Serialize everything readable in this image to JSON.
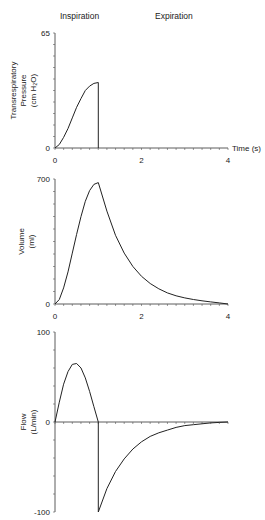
{
  "header": {
    "inspiration_label": "Inspiration",
    "expiration_label": "Expiration"
  },
  "chart_data": [
    {
      "type": "line",
      "title": "",
      "xlabel": "Time (s)",
      "ylabel": "Transrespiratory Pressure (cm H2O)",
      "ylabel_lines": [
        "Transrespiratory",
        "Pressure",
        "(cm H₂O)"
      ],
      "xlim": [
        0,
        4
      ],
      "ylim": [
        0,
        65
      ],
      "x_ticks": [
        0,
        2,
        4
      ],
      "y_ticks": [
        0,
        65
      ],
      "grid": false,
      "series": [
        {
          "name": "Pressure",
          "x": [
            0,
            0.1,
            0.2,
            0.3,
            0.4,
            0.5,
            0.6,
            0.7,
            0.8,
            0.9,
            1.0,
            1.0
          ],
          "values": [
            0,
            2,
            6,
            11,
            17,
            23,
            28,
            32.5,
            35,
            36.5,
            37,
            0
          ]
        }
      ]
    },
    {
      "type": "line",
      "title": "",
      "xlabel": "",
      "ylabel": "Volume (ml)",
      "ylabel_lines": [
        "Volume",
        "(ml)"
      ],
      "xlim": [
        0,
        4
      ],
      "ylim": [
        0,
        700
      ],
      "x_ticks": [
        0,
        2,
        4
      ],
      "y_ticks": [
        0,
        700
      ],
      "grid": false,
      "series": [
        {
          "name": "Volume",
          "x": [
            0,
            0.1,
            0.2,
            0.3,
            0.4,
            0.5,
            0.6,
            0.7,
            0.8,
            0.9,
            1.0,
            1.2,
            1.4,
            1.6,
            1.8,
            2.0,
            2.2,
            2.4,
            2.6,
            2.8,
            3.0,
            3.2,
            3.4,
            3.6,
            3.8,
            4.0
          ],
          "values": [
            0,
            25,
            90,
            180,
            285,
            390,
            490,
            575,
            635,
            670,
            680,
            520,
            385,
            285,
            210,
            155,
            115,
            85,
            62,
            46,
            34,
            25,
            18,
            12,
            6,
            0
          ]
        }
      ]
    },
    {
      "type": "line",
      "title": "",
      "xlabel": "",
      "ylabel": "Flow (L/min)",
      "ylabel_lines": [
        "Flow",
        "(L/min)"
      ],
      "xlim": [
        0,
        4
      ],
      "ylim": [
        -100,
        100
      ],
      "x_ticks": [],
      "y_ticks": [
        -100,
        0,
        100
      ],
      "grid": false,
      "series": [
        {
          "name": "Flow",
          "x": [
            0,
            0.1,
            0.2,
            0.3,
            0.4,
            0.5,
            0.6,
            0.7,
            0.8,
            0.9,
            1.0,
            1.0,
            1.2,
            1.4,
            1.6,
            1.8,
            2.0,
            2.2,
            2.4,
            2.6,
            2.8,
            3.0,
            3.2,
            3.4,
            3.6,
            3.8,
            4.0
          ],
          "values": [
            0,
            22,
            42,
            56,
            64,
            65,
            60,
            49,
            34,
            17,
            0,
            -100,
            -74,
            -55,
            -41,
            -30,
            -22,
            -16,
            -12,
            -9,
            -6,
            -4,
            -3,
            -2,
            -1,
            -0.5,
            0
          ]
        }
      ]
    }
  ]
}
